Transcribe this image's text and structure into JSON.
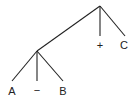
{
  "diagram": {
    "type": "parse-tree",
    "nodes": [
      {
        "id": "root",
        "label": "",
        "x": 100,
        "y": 6
      },
      {
        "id": "n1",
        "label": "",
        "x": 37,
        "y": 51
      },
      {
        "id": "plus",
        "label": "+",
        "x": 100,
        "y": 36
      },
      {
        "id": "c",
        "label": "C",
        "x": 125,
        "y": 36
      },
      {
        "id": "a",
        "label": "A",
        "x": 12,
        "y": 81
      },
      {
        "id": "minus",
        "label": "−",
        "x": 37,
        "y": 81
      },
      {
        "id": "b",
        "label": "B",
        "x": 63,
        "y": 81
      }
    ],
    "edges": [
      [
        "root",
        "n1"
      ],
      [
        "root",
        "plus"
      ],
      [
        "root",
        "c"
      ],
      [
        "n1",
        "a"
      ],
      [
        "n1",
        "minus"
      ],
      [
        "n1",
        "b"
      ]
    ],
    "labels": {
      "plus": "+",
      "c": "C",
      "a": "A",
      "minus": "−",
      "b": "B"
    }
  }
}
